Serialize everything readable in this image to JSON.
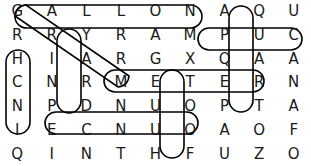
{
  "puzzle": {
    "type": "word-search",
    "columns": 9,
    "rows": 7,
    "grid": [
      [
        "G",
        "A",
        "L",
        "L",
        "O",
        "N",
        "A",
        "Q",
        "U"
      ],
      [
        "R",
        "R",
        "Y",
        "R",
        "A",
        "M",
        "P",
        "U",
        "C"
      ],
      [
        "H",
        "I",
        "A",
        "R",
        "G",
        "X",
        "Q",
        "A",
        "A"
      ],
      [
        "C",
        "N",
        "R",
        "M",
        "E",
        "T",
        "E",
        "R",
        "N"
      ],
      [
        "N",
        "P",
        "D",
        "N",
        "U",
        "O",
        "P",
        "T",
        "A"
      ],
      [
        "I",
        "E",
        "C",
        "N",
        "U",
        "O",
        "A",
        "O",
        "F"
      ],
      [
        "Q",
        "I",
        "N",
        "T",
        "H",
        "F",
        "U",
        "Z",
        "O"
      ]
    ],
    "found_words": [
      {
        "word": "GALLON",
        "direction": "horizontal",
        "row": 1,
        "start_col": 1,
        "end_col": 6
      },
      {
        "word": "PUC",
        "direction": "horizontal",
        "row": 2,
        "start_col": 7,
        "end_col": 9
      },
      {
        "word": "METER",
        "direction": "horizontal",
        "row": 4,
        "start_col": 4,
        "end_col": 8
      },
      {
        "word": "ECNUO",
        "direction": "horizontal",
        "row": 6,
        "start_col": 2,
        "end_col": 6
      },
      {
        "word": "HCNI",
        "direction": "vertical",
        "col": 1,
        "start_row": 3,
        "end_row": 6
      },
      {
        "word": "YARD",
        "direction": "vertical",
        "col": 3,
        "start_row": 2,
        "end_row": 5
      },
      {
        "word": "TOOF",
        "direction": "vertical",
        "col": 6,
        "start_row": 4,
        "end_row": 7
      },
      {
        "word": "QUART",
        "direction": "vertical",
        "col": 8,
        "start_row": 1,
        "end_row": 5
      },
      {
        "word": "GRAM",
        "direction": "diagonal",
        "start_row": 1,
        "start_col": 1,
        "end_row": 4,
        "end_col": 4
      }
    ],
    "colors": {
      "letter": "#1a1a1a",
      "mark": "#000000",
      "background": "#ffffff"
    }
  }
}
